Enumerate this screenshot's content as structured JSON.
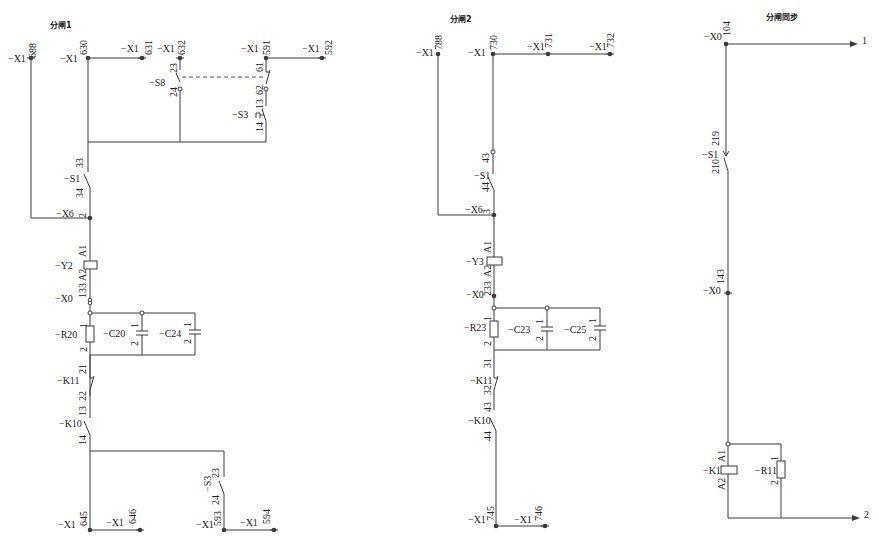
{
  "sections": {
    "s1": {
      "title": "分闸1"
    },
    "s2": {
      "title": "分闸2"
    },
    "s3": {
      "title": "分闸同步"
    }
  },
  "s1": {
    "x1_688": {
      "dev": "−X1",
      "pin": "688"
    },
    "x1_630": {
      "dev": "−X1",
      "pin": "630"
    },
    "x1_631": {
      "dev": "−X1",
      "pin": "631"
    },
    "x1_632": {
      "dev": "−X1",
      "pin": "632"
    },
    "x1_591": {
      "dev": "−X1",
      "pin": "591"
    },
    "x1_592": {
      "dev": "−X1",
      "pin": "592"
    },
    "s8": {
      "dev": "−S8",
      "p1": "23",
      "p2": "24",
      "p3": "61",
      "p4": "62"
    },
    "s3top": {
      "dev": "−S3",
      "p1": "13",
      "p2": "14"
    },
    "s1": {
      "dev": "−S1",
      "p1": "33",
      "p2": "34"
    },
    "x6": {
      "dev": "−X6",
      "pin": "2"
    },
    "y2": {
      "dev": "−Y2",
      "p1": "A1",
      "p2": "A2"
    },
    "x0": {
      "dev": "−X0",
      "pin": "133"
    },
    "r20": {
      "dev": "−R20",
      "p1": "1",
      "p2": "2"
    },
    "c20": {
      "dev": "−C20",
      "p1": "1",
      "p2": "2"
    },
    "c24": {
      "dev": "−C24",
      "p1": "1",
      "p2": "2"
    },
    "k11": {
      "dev": "−K11",
      "p1": "21",
      "p2": "22"
    },
    "k10": {
      "dev": "−K10",
      "p1": "13",
      "p2": "14"
    },
    "s3bot": {
      "dev": "−S3",
      "p1": "23",
      "p2": "24"
    },
    "x1_645": {
      "dev": "−X1",
      "pin": "645"
    },
    "x1_646": {
      "dev": "−X1",
      "pin": "646"
    },
    "x1_593": {
      "dev": "−X1",
      "pin": "593"
    },
    "x1_594": {
      "dev": "−X1",
      "pin": "594"
    }
  },
  "s2": {
    "x1_788": {
      "dev": "−X1",
      "pin": "788"
    },
    "x1_730": {
      "dev": "−X1",
      "pin": "730"
    },
    "x1_731": {
      "dev": "−X1",
      "pin": "731"
    },
    "x1_732": {
      "dev": "−X1",
      "pin": "732"
    },
    "s1": {
      "dev": "−S1",
      "p1": "43",
      "p2": "44"
    },
    "x6": {
      "dev": "−X6",
      "pin": "3"
    },
    "y3": {
      "dev": "−Y3",
      "p1": "A1",
      "p2": "A2"
    },
    "x0": {
      "dev": "−X0",
      "pin": "233"
    },
    "r23": {
      "dev": "−R23",
      "p1": "1",
      "p2": "2"
    },
    "c23": {
      "dev": "−C23",
      "p1": "1",
      "p2": "2"
    },
    "c25": {
      "dev": "−C25",
      "p1": "1",
      "p2": "2"
    },
    "k11": {
      "dev": "−K11",
      "p1": "31",
      "p2": "32"
    },
    "k10": {
      "dev": "−K10",
      "p1": "43",
      "p2": "44"
    },
    "x1_745": {
      "dev": "−X1",
      "pin": "745"
    },
    "x1_746": {
      "dev": "−X1",
      "pin": "746"
    }
  },
  "s3": {
    "x0_104": {
      "dev": "−X0",
      "pin": "104"
    },
    "out1": "1",
    "s1": {
      "dev": "−S1",
      "p1": "219",
      "p2": "210"
    },
    "x0_143": {
      "dev": "−X0",
      "pin": "143"
    },
    "k11": {
      "dev": "−K11",
      "p1": "A1",
      "p2": "A2"
    },
    "r11": {
      "dev": "−R11",
      "p1": "1",
      "p2": "2"
    },
    "out2": "2"
  }
}
